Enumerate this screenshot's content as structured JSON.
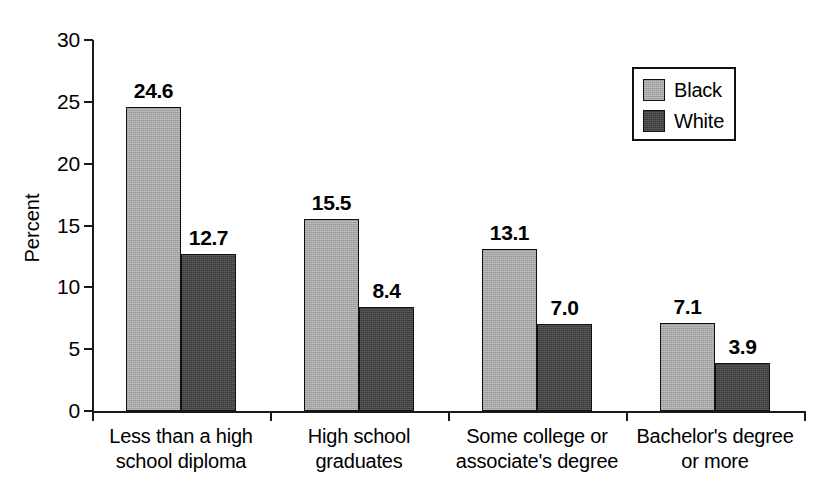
{
  "chart_data": {
    "type": "bar",
    "title": "",
    "xlabel": "",
    "ylabel": "Percent",
    "ylim": [
      0,
      30
    ],
    "ytick_labels": [
      "0",
      "5",
      "10",
      "15",
      "20",
      "25",
      "30"
    ],
    "ytick_values": [
      0,
      5,
      10,
      15,
      20,
      25,
      30
    ],
    "grid": false,
    "legend_position": "top-right",
    "categories": [
      "Less than a high school diploma",
      "High school graduates",
      "Some college or associate's degree",
      "Bachelor's degree or more"
    ],
    "category_lines": [
      [
        "Less than a high",
        "school diploma"
      ],
      [
        "High school",
        "graduates"
      ],
      [
        "Some college or",
        "associate's degree"
      ],
      [
        "Bachelor's degree",
        "or more"
      ]
    ],
    "series": [
      {
        "name": "Black",
        "color": "#a3a3a3",
        "values": [
          24.6,
          15.5,
          13.1,
          7.1
        ],
        "value_labels": [
          "24.6",
          "15.5",
          "13.1",
          "7.1"
        ]
      },
      {
        "name": "White",
        "color": "#383838",
        "values": [
          12.7,
          8.4,
          7.0,
          3.9
        ],
        "value_labels": [
          "12.7",
          "8.4",
          "7.0",
          "3.9"
        ]
      }
    ]
  },
  "legend": {
    "items": [
      {
        "label": "Black",
        "swatch": "light-gray-swatch"
      },
      {
        "label": "White",
        "swatch": "dark-gray-swatch"
      }
    ]
  },
  "axes": {
    "y_title": "Percent"
  }
}
